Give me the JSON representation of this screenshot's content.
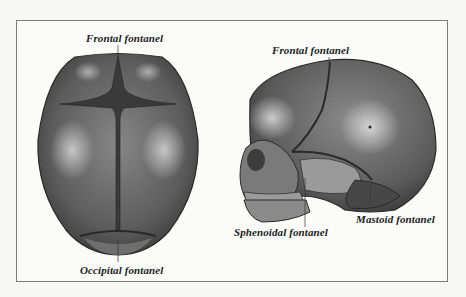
{
  "figure": {
    "views": [
      {
        "name": "superior view",
        "labels": {
          "top": "Frontal fontanel",
          "bottom": "Occipital fontanel"
        }
      },
      {
        "name": "lateral view",
        "labels": {
          "top": "Frontal fontanel",
          "sphenoidal": "Sphenoidal fontanel",
          "mastoid": "Mastoid fontanel"
        }
      }
    ]
  },
  "colors": {
    "bone_dark": "#3e3e3e",
    "bone_mid": "#6a6a6a",
    "bone_light": "#d8d8d8",
    "frame_border": "#7d7d7d",
    "background": "#fbfbfa"
  }
}
